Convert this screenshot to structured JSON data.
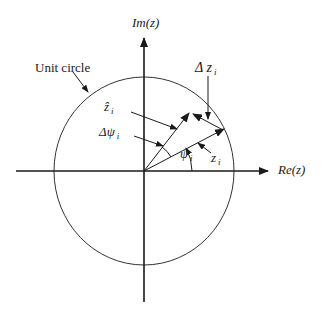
{
  "diagram": {
    "axes": {
      "imag_label": "Im(z)",
      "real_label": "Re(z)"
    },
    "labels": {
      "unit_circle": "Unit circle",
      "delta_z": "Δ z",
      "delta_z_sub": "i",
      "z_hat": "ẑ",
      "z_hat_sub": "i",
      "delta_psi": "Δψ",
      "delta_psi_sub": "i",
      "psi": "ψ",
      "psi_sub": "i",
      "z": "z",
      "z_sub": "i"
    },
    "colors": {
      "stroke": "#1a1a1a",
      "background": "#ffffff"
    }
  }
}
